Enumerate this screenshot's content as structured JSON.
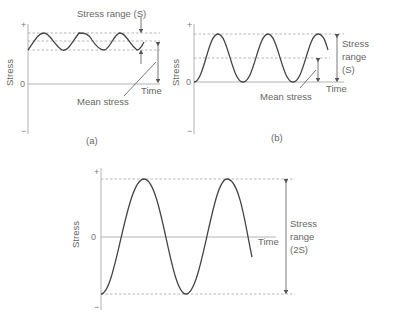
{
  "figure": {
    "panels": [
      {
        "id": "a",
        "caption": "(a)",
        "y_axis_label": "Stress",
        "tick_plus": "+",
        "tick_zero": "0",
        "tick_minus": "−",
        "x_axis_label": "Time",
        "annotation_range": "Stress range (S)",
        "annotation_mean": "Mean stress"
      },
      {
        "id": "b",
        "caption": "(b)",
        "y_axis_label": "Stress",
        "tick_plus": "+",
        "tick_zero": "0",
        "tick_minus": "−",
        "x_axis_label": "Time",
        "annotation_range_lines": [
          "Stress",
          "range",
          "(S)"
        ],
        "annotation_mean": "Mean stress"
      },
      {
        "id": "c",
        "caption": "",
        "y_axis_label": "Stress",
        "tick_plus": "+",
        "tick_zero": "0",
        "tick_minus": "−",
        "x_axis_label": "Time",
        "annotation_range_lines": [
          "Stress",
          "range",
          "(2S)"
        ]
      }
    ]
  }
}
